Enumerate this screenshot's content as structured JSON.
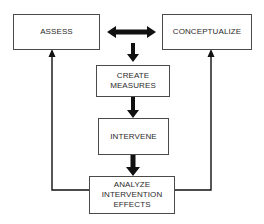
{
  "diagram": {
    "type": "flowchart",
    "nodes": [
      {
        "id": "assess",
        "label": "ASSESS"
      },
      {
        "id": "conceptualize",
        "label": "CONCEPTUALIZE"
      },
      {
        "id": "create_measures",
        "lines": [
          "CREATE",
          "MEASURES"
        ]
      },
      {
        "id": "intervene",
        "label": "INTERVENE"
      },
      {
        "id": "analyze",
        "lines": [
          "ANALYZE",
          "INTERVENTION",
          "EFFECTS"
        ]
      }
    ],
    "edges": [
      {
        "from": "assess",
        "to": "conceptualize",
        "style": "bold-double-arrow"
      },
      {
        "from": "assess-conceptualize",
        "to": "create_measures",
        "style": "bold-arrow"
      },
      {
        "from": "create_measures",
        "to": "intervene",
        "style": "bold-arrow"
      },
      {
        "from": "intervene",
        "to": "analyze",
        "style": "bold-arrow"
      },
      {
        "from": "analyze",
        "to": "assess",
        "style": "thin-arrow-feedback"
      },
      {
        "from": "analyze",
        "to": "conceptualize",
        "style": "thin-arrow-feedback"
      }
    ],
    "colors": {
      "stroke": "#4a4a4a",
      "arrow": "#111111",
      "text": "#2b2b2b",
      "background": "#ffffff"
    }
  }
}
